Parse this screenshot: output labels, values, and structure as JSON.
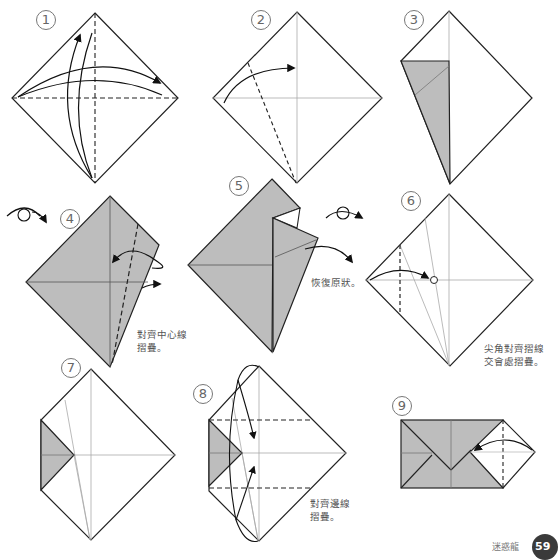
{
  "steps": [
    {
      "number": "1"
    },
    {
      "number": "2"
    },
    {
      "number": "3"
    },
    {
      "number": "4",
      "note": "對齊中心線\n摺疊。"
    },
    {
      "number": "5",
      "note": "恢復原狀。"
    },
    {
      "number": "6",
      "note": "尖角對齊摺線\n交會處摺疊。"
    },
    {
      "number": "7"
    },
    {
      "number": "8",
      "note": "對齊邊線\n摺疊。"
    },
    {
      "number": "9"
    }
  ],
  "footer": {
    "label": "迷惑龍",
    "page_number": "59"
  },
  "colors": {
    "paper_back": "#bdbdbd",
    "line": "#222222",
    "crease": "#a8a8a8"
  }
}
